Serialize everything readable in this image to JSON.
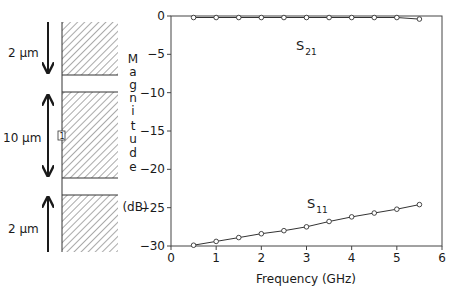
{
  "diagram": {
    "layers": [
      {
        "thickness_label": "2 μm",
        "arrow": "down"
      },
      {
        "thickness_label": "10 μm",
        "arrow": "both"
      },
      {
        "thickness_label": "2 μm",
        "arrow": "up"
      }
    ],
    "marker_label": "1"
  },
  "chart_data": {
    "type": "line",
    "title": "",
    "xlabel": "Frequency (GHz)",
    "ylabel": "Magnitude (dB)",
    "ylabel_letters": [
      "M",
      "a",
      "g",
      "n",
      "i",
      "t",
      "u",
      "d",
      "e"
    ],
    "ylabel_unit": "(dB)",
    "xlim": [
      0,
      6
    ],
    "ylim": [
      -30,
      0
    ],
    "xticks": [
      0,
      1,
      2,
      3,
      4,
      5,
      6
    ],
    "yticks": [
      0,
      -5,
      -10,
      -15,
      -20,
      -25,
      -30
    ],
    "xtick_labels": [
      "0",
      "1",
      "2",
      "3",
      "4",
      "5",
      "6"
    ],
    "ytick_labels": [
      "0",
      "−5",
      "−10",
      "−15",
      "−20",
      "−25",
      "−30"
    ],
    "grid": false,
    "legend": "inline annotations",
    "series": [
      {
        "name": "S21",
        "label_main": "S",
        "label_sub": "21",
        "x": [
          0.5,
          1.0,
          1.5,
          2.0,
          2.5,
          3.0,
          3.5,
          4.0,
          4.5,
          5.0,
          5.5
        ],
        "values": [
          -0.2,
          -0.2,
          -0.2,
          -0.2,
          -0.2,
          -0.2,
          -0.2,
          -0.2,
          -0.2,
          -0.2,
          -0.4
        ]
      },
      {
        "name": "S11",
        "label_main": "S",
        "label_sub": "11",
        "x": [
          0.5,
          1.0,
          1.5,
          2.0,
          2.5,
          3.0,
          3.5,
          4.0,
          4.5,
          5.0,
          5.5
        ],
        "values": [
          -29.9,
          -29.4,
          -28.9,
          -28.4,
          -28.0,
          -27.5,
          -26.8,
          -26.2,
          -25.7,
          -25.2,
          -24.6
        ]
      }
    ]
  }
}
